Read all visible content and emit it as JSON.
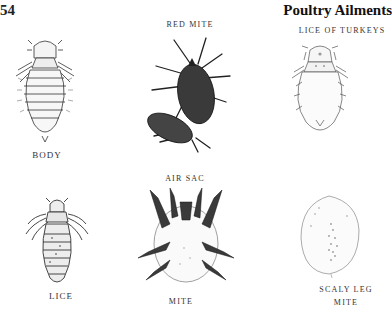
{
  "page": {
    "number": "54",
    "running_head": "Poultry Ailments"
  },
  "figures": [
    {
      "id": "body-louse",
      "caption": "BODY",
      "icon": "body-louse-illustration"
    },
    {
      "id": "red-mite",
      "caption": "RED MITE",
      "icon": "red-mite-illustration"
    },
    {
      "id": "turkey-lice",
      "caption": "LICE OF TURKEYS",
      "icon": "turkey-louse-illustration"
    },
    {
      "id": "lice",
      "caption": "LICE",
      "icon": "louse-illustration"
    },
    {
      "id": "air-sac-mite",
      "caption_top": "AIR SAC",
      "caption_bottom": "MITE",
      "icon": "air-sac-mite-illustration"
    },
    {
      "id": "scaly-leg-mite",
      "caption_line1": "SCALY LEG",
      "caption_line2": "MITE",
      "icon": "scaly-leg-mite-illustration"
    }
  ]
}
